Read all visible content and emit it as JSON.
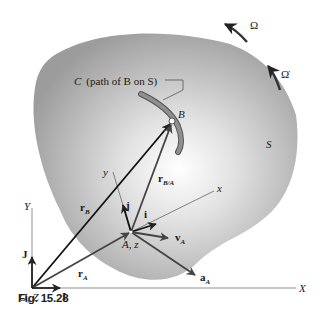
{
  "caption": "Fig. 15.28",
  "labels": {
    "omega": "Ω",
    "omega_dot": "Ω̇",
    "curve_label_C": "C",
    "curve_label_text": "(path of B on S)",
    "point_B": "B",
    "body_S": "S",
    "axis_x": "x",
    "axis_y": "y",
    "axis_X": "X",
    "axis_Y": "Y",
    "point_A": "A, z",
    "origin": "O, Z",
    "unit_i": "i",
    "unit_j": "j",
    "unit_I": "I",
    "unit_J": "J",
    "r_B": "r",
    "r_B_sub": "B",
    "r_A": "r",
    "r_A_sub": "A",
    "r_BA": "r",
    "r_BA_sub": "B/A",
    "v_A": "v",
    "v_A_sub": "A",
    "a_A": "a",
    "a_A_sub": "A"
  },
  "colors": {
    "body_fill_center": "#ffffff",
    "body_fill_edge": "#9a9a9a",
    "vector": "#222222",
    "vector_gray": "#444444",
    "axis": "#777777"
  }
}
